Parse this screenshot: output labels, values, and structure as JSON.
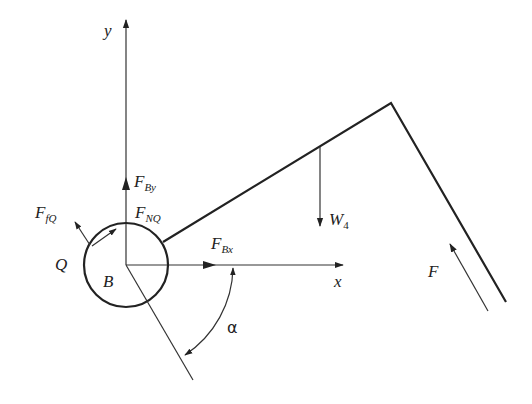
{
  "labels": {
    "y_axis": "y",
    "x_axis": "x",
    "F_By": {
      "main": "F",
      "sub": "By"
    },
    "F_Bx": {
      "main": "F",
      "sub": "Bx"
    },
    "F_NQ": {
      "main": "F",
      "sub": "NQ"
    },
    "F_fQ": {
      "main": "F",
      "sub": "fQ"
    },
    "Q": "Q",
    "B": "B",
    "W4": {
      "main": "W",
      "sub": "4"
    },
    "F": "F",
    "alpha": "α"
  },
  "colors": {
    "stroke": "#222222",
    "background": "#ffffff"
  }
}
